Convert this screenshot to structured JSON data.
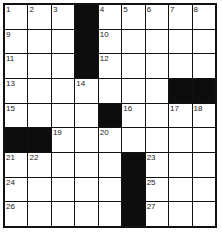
{
  "puzzle": {
    "rows": 9,
    "cols": 9,
    "colors": {
      "block": "#0d0d0d",
      "cell": "#ffffff",
      "border": "#111111",
      "number": "#222222"
    },
    "grid": [
      [
        "1",
        "2",
        "3",
        "#",
        "4",
        "5",
        "6",
        "7",
        "8"
      ],
      [
        "9",
        "",
        "",
        "#",
        "10",
        "",
        "",
        "",
        ""
      ],
      [
        "11",
        "",
        "",
        "#",
        "12",
        "",
        "",
        "",
        ""
      ],
      [
        "13",
        "",
        "",
        "14",
        "",
        "",
        "",
        "#",
        "#"
      ],
      [
        "15",
        "",
        "",
        "",
        "#",
        "16",
        "",
        "17",
        "18"
      ],
      [
        "#",
        "#",
        "19",
        "",
        "20",
        "",
        "",
        "",
        ""
      ],
      [
        "21",
        "22",
        "",
        "",
        "",
        "#",
        "23",
        "",
        ""
      ],
      [
        "24",
        "",
        "",
        "",
        "",
        "#",
        "25",
        "",
        ""
      ],
      [
        "26",
        "",
        "",
        "",
        "",
        "#",
        "27",
        "",
        ""
      ]
    ]
  }
}
